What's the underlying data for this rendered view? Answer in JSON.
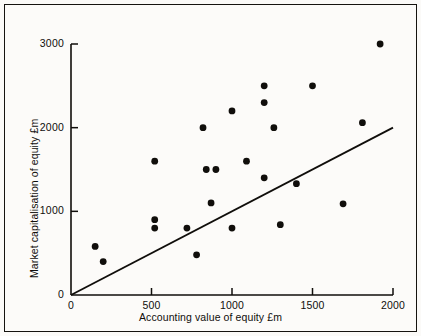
{
  "chart_data": {
    "type": "scatter",
    "title": "",
    "xlabel": "Accounting value of equity £m",
    "ylabel": "Market capitalisation of equity £m",
    "xlim": [
      0,
      2000
    ],
    "ylim": [
      0,
      3000
    ],
    "xticks": [
      0,
      500,
      1000,
      1500,
      2000
    ],
    "yticks": [
      0,
      1000,
      2000,
      3000
    ],
    "xtick_labels": [
      "0",
      "500",
      "1000",
      "1500",
      "2000"
    ],
    "ytick_labels": [
      "0",
      "1000",
      "2000",
      "3000"
    ],
    "grid": false,
    "legend": false,
    "marker": "filled-circle",
    "marker_color": "#100e0b",
    "points": [
      {
        "x": 150,
        "y": 580
      },
      {
        "x": 200,
        "y": 400
      },
      {
        "x": 520,
        "y": 1600
      },
      {
        "x": 520,
        "y": 900
      },
      {
        "x": 520,
        "y": 800
      },
      {
        "x": 720,
        "y": 800
      },
      {
        "x": 780,
        "y": 480
      },
      {
        "x": 820,
        "y": 2000
      },
      {
        "x": 840,
        "y": 1500
      },
      {
        "x": 870,
        "y": 1100
      },
      {
        "x": 900,
        "y": 1500
      },
      {
        "x": 1000,
        "y": 2200
      },
      {
        "x": 1000,
        "y": 800
      },
      {
        "x": 1090,
        "y": 1600
      },
      {
        "x": 1200,
        "y": 2500
      },
      {
        "x": 1200,
        "y": 2300
      },
      {
        "x": 1200,
        "y": 1400
      },
      {
        "x": 1260,
        "y": 2000
      },
      {
        "x": 1300,
        "y": 840
      },
      {
        "x": 1400,
        "y": 1330
      },
      {
        "x": 1500,
        "y": 2500
      },
      {
        "x": 1690,
        "y": 1090
      },
      {
        "x": 1810,
        "y": 2060
      },
      {
        "x": 1920,
        "y": 3000
      }
    ],
    "trendline": {
      "from": {
        "x": 0,
        "y": 0
      },
      "to": {
        "x": 2000,
        "y": 2000
      },
      "color": "#100e0b"
    }
  }
}
